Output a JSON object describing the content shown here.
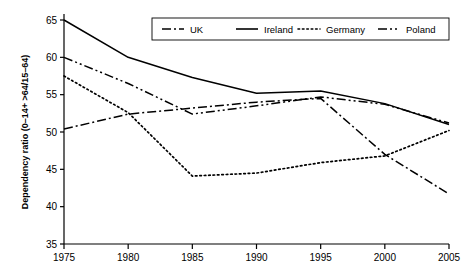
{
  "chart_data": {
    "type": "line",
    "title": "",
    "xlabel": "",
    "ylabel": "Dependency ratio (0–14+ >64/15–64)",
    "x": [
      1975,
      1980,
      1985,
      1990,
      1995,
      2000,
      2005
    ],
    "xticklabels": [
      "1975",
      "1980",
      "1985",
      "1990",
      "1995",
      "2000",
      "2005"
    ],
    "yticklabels": [
      "35",
      "40",
      "45",
      "50",
      "55",
      "60",
      "65"
    ],
    "yticks": [
      35,
      40,
      45,
      50,
      55,
      60,
      65
    ],
    "xlim": [
      1975,
      2005
    ],
    "ylim": [
      35,
      65
    ],
    "grid": false,
    "legend_position": "top-center",
    "series": [
      {
        "name": "UK",
        "dash_style": "dash-dot",
        "color": "#000000",
        "values": [
          50.4,
          52.4,
          53.2,
          54.0,
          54.5,
          47.0,
          41.7
        ]
      },
      {
        "name": "Ireland",
        "dash_style": "solid",
        "color": "#000000",
        "values": [
          65.0,
          60.0,
          57.3,
          55.2,
          55.5,
          53.8,
          51.0
        ]
      },
      {
        "name": "Germany",
        "dash_style": "dotted",
        "color": "#000000",
        "values": [
          57.5,
          52.6,
          44.1,
          44.5,
          45.9,
          46.8,
          50.2
        ]
      },
      {
        "name": "Poland",
        "dash_style": "dash-dot-dot",
        "color": "#000000",
        "values": [
          60.0,
          56.5,
          52.4,
          53.5,
          54.7,
          53.7,
          51.2
        ]
      }
    ]
  },
  "legend": {
    "items": [
      {
        "label": "UK"
      },
      {
        "label": "Ireland"
      },
      {
        "label": "Germany"
      },
      {
        "label": "Poland"
      }
    ]
  }
}
